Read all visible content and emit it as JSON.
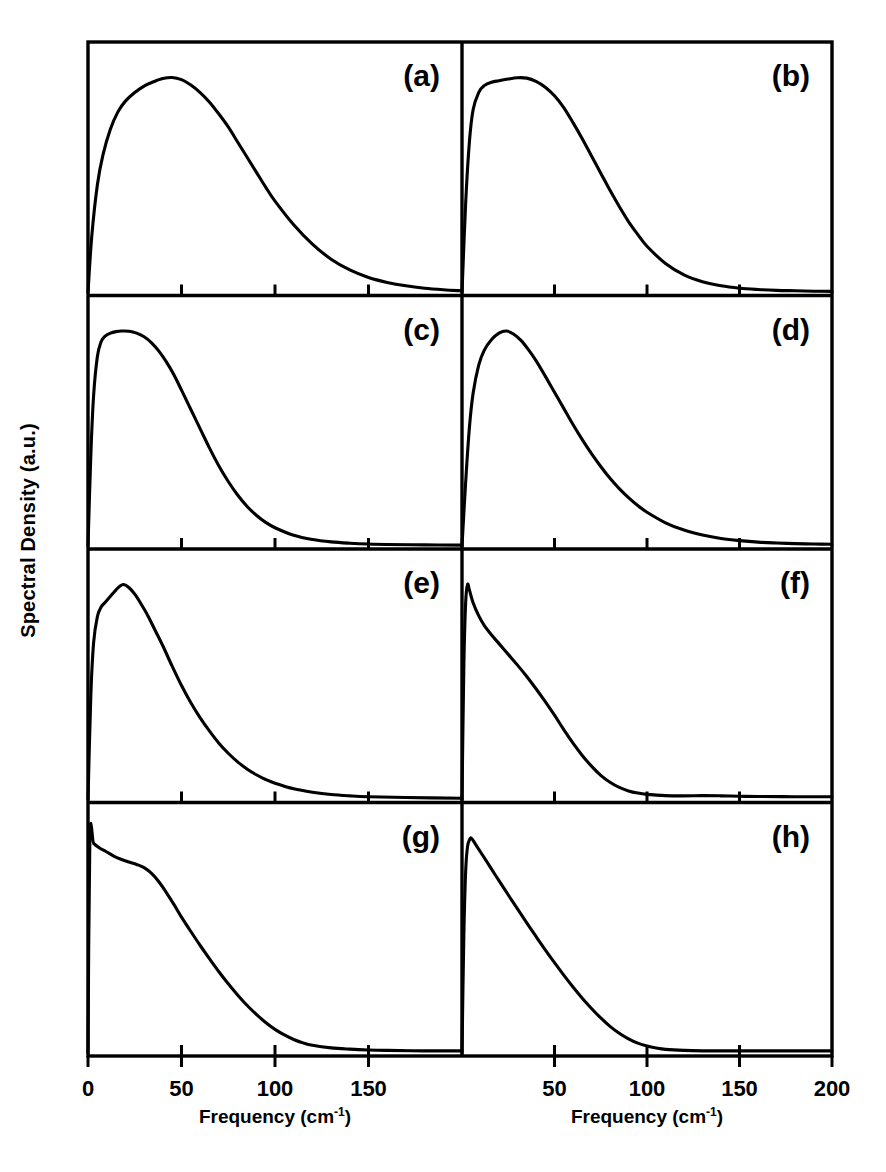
{
  "figure": {
    "ylabel": "Spectral Density (a.u.)",
    "xlabel_left_main": "Frequency (cm",
    "xlabel_left_sup": "-1",
    "xlabel_left_close": ")",
    "xlabel_right_main": "Frequency (cm",
    "xlabel_right_sup": "-1",
    "xlabel_right_close": ")",
    "line_color": "#000000",
    "axis_color": "#000000",
    "background_color": "#ffffff"
  },
  "axes": {
    "x_min": 0,
    "x_max": 200,
    "x_ticks_left": [
      0,
      50,
      100,
      150
    ],
    "x_tick_labels_left": [
      "0",
      "50",
      "100",
      "150"
    ],
    "x_ticks_right": [
      50,
      100,
      150,
      200
    ],
    "x_tick_labels_right": [
      "50",
      "100",
      "150",
      "200"
    ],
    "y_min": 0,
    "y_max": 1,
    "y_ticks": [],
    "y_tick_labels": [],
    "grid": false,
    "legend": "none"
  },
  "chart_data": {
    "type": "line",
    "title": "",
    "xlabel": "Frequency (cm-1)",
    "ylabel": "Spectral Density (a.u.)",
    "xlim": [
      0,
      200
    ],
    "ylim": [
      0,
      1
    ],
    "grid": false,
    "legend_position": "none",
    "panel_layout": {
      "rows": 4,
      "cols": 2
    },
    "panels": [
      {
        "label": "(a)",
        "row": 0,
        "col": 0,
        "peak_frequency": 45,
        "x": [
          0,
          2,
          5,
          8,
          12,
          16,
          20,
          25,
          30,
          35,
          40,
          45,
          50,
          55,
          60,
          65,
          70,
          75,
          80,
          85,
          90,
          95,
          100,
          110,
          120,
          130,
          140,
          150,
          160,
          170,
          180,
          190,
          200
        ],
        "y": [
          0.0,
          0.26,
          0.5,
          0.64,
          0.76,
          0.84,
          0.89,
          0.93,
          0.96,
          0.98,
          0.995,
          1.0,
          0.99,
          0.965,
          0.93,
          0.885,
          0.83,
          0.77,
          0.7,
          0.63,
          0.56,
          0.49,
          0.425,
          0.315,
          0.225,
          0.155,
          0.105,
          0.07,
          0.047,
          0.031,
          0.02,
          0.013,
          0.008
        ]
      },
      {
        "label": "(b)",
        "row": 0,
        "col": 1,
        "peak_frequency": 33,
        "x": [
          0,
          2,
          4,
          6,
          9,
          12,
          16,
          20,
          25,
          30,
          35,
          40,
          45,
          50,
          55,
          60,
          65,
          70,
          75,
          80,
          85,
          90,
          95,
          100,
          110,
          120,
          130,
          140,
          150,
          160,
          170,
          180,
          190,
          200
        ],
        "y": [
          0.0,
          0.42,
          0.7,
          0.85,
          0.93,
          0.962,
          0.978,
          0.985,
          0.993,
          0.999,
          0.997,
          0.982,
          0.955,
          0.915,
          0.86,
          0.79,
          0.715,
          0.635,
          0.555,
          0.475,
          0.4,
          0.33,
          0.27,
          0.215,
          0.135,
          0.082,
          0.05,
          0.031,
          0.02,
          0.014,
          0.01,
          0.008,
          0.006,
          0.005
        ]
      },
      {
        "label": "(c)",
        "row": 1,
        "col": 0,
        "peak_frequency": 22,
        "x": [
          0,
          1.5,
          3,
          5,
          7,
          9,
          12,
          15,
          18,
          22,
          26,
          30,
          34,
          38,
          42,
          46,
          50,
          55,
          60,
          65,
          70,
          75,
          80,
          85,
          90,
          95,
          100,
          110,
          120,
          130,
          140,
          150,
          160,
          180,
          200
        ],
        "y": [
          0.0,
          0.42,
          0.7,
          0.88,
          0.95,
          0.975,
          0.99,
          0.997,
          1.0,
          0.999,
          0.99,
          0.973,
          0.945,
          0.905,
          0.855,
          0.795,
          0.725,
          0.635,
          0.545,
          0.455,
          0.372,
          0.3,
          0.237,
          0.185,
          0.143,
          0.11,
          0.085,
          0.05,
          0.03,
          0.019,
          0.013,
          0.009,
          0.007,
          0.005,
          0.004
        ]
      },
      {
        "label": "(d)",
        "row": 1,
        "col": 1,
        "peak_frequency": 24,
        "x": [
          0,
          2,
          4,
          6,
          9,
          12,
          16,
          20,
          24,
          28,
          32,
          36,
          40,
          45,
          50,
          55,
          60,
          65,
          70,
          75,
          80,
          85,
          90,
          95,
          100,
          110,
          120,
          130,
          140,
          150,
          160,
          170,
          180,
          190,
          200
        ],
        "y": [
          0.0,
          0.3,
          0.55,
          0.71,
          0.84,
          0.91,
          0.96,
          0.99,
          1.0,
          0.985,
          0.955,
          0.912,
          0.862,
          0.79,
          0.715,
          0.64,
          0.565,
          0.495,
          0.43,
          0.37,
          0.315,
          0.267,
          0.225,
          0.188,
          0.157,
          0.108,
          0.074,
          0.051,
          0.035,
          0.025,
          0.018,
          0.014,
          0.011,
          0.009,
          0.008
        ]
      },
      {
        "label": "(e)",
        "row": 2,
        "col": 0,
        "peak_frequency": 19,
        "x": [
          0,
          1.5,
          3,
          5,
          7,
          9,
          12,
          15,
          17,
          19,
          22,
          25,
          28,
          32,
          36,
          40,
          45,
          50,
          55,
          60,
          65,
          70,
          75,
          80,
          85,
          90,
          95,
          100,
          110,
          120,
          130,
          140,
          150,
          170,
          200
        ],
        "y": [
          0.0,
          0.48,
          0.73,
          0.85,
          0.895,
          0.915,
          0.945,
          0.975,
          0.992,
          1.0,
          0.985,
          0.955,
          0.915,
          0.855,
          0.785,
          0.715,
          0.62,
          0.53,
          0.45,
          0.38,
          0.318,
          0.262,
          0.215,
          0.175,
          0.142,
          0.115,
          0.093,
          0.076,
          0.05,
          0.034,
          0.023,
          0.017,
          0.013,
          0.009,
          0.006
        ]
      },
      {
        "label": "(f)",
        "row": 2,
        "col": 1,
        "peak_frequency": 3,
        "x": [
          0,
          1,
          2,
          3,
          4,
          6,
          9,
          12,
          16,
          20,
          25,
          30,
          35,
          40,
          45,
          50,
          55,
          60,
          65,
          70,
          75,
          80,
          85,
          90,
          95,
          100,
          110,
          120,
          130,
          140,
          150,
          160,
          180,
          200
        ],
        "y": [
          0.0,
          0.62,
          0.92,
          1.0,
          0.975,
          0.915,
          0.855,
          0.81,
          0.765,
          0.725,
          0.675,
          0.625,
          0.572,
          0.515,
          0.455,
          0.392,
          0.325,
          0.262,
          0.205,
          0.155,
          0.112,
          0.08,
          0.056,
          0.04,
          0.03,
          0.024,
          0.018,
          0.017,
          0.018,
          0.017,
          0.015,
          0.014,
          0.013,
          0.013
        ]
      },
      {
        "label": "(g)",
        "row": 3,
        "col": 0,
        "peak_frequency": 1,
        "x": [
          0,
          1,
          3,
          6,
          10,
          14,
          18,
          22,
          26,
          30,
          34,
          38,
          42,
          46,
          50,
          55,
          60,
          65,
          70,
          75,
          80,
          85,
          90,
          95,
          100,
          105,
          110,
          115,
          120,
          130,
          140,
          150,
          160,
          180,
          200
        ],
        "y": [
          0.0,
          1.0,
          0.975,
          0.955,
          0.935,
          0.915,
          0.9,
          0.888,
          0.877,
          0.862,
          0.835,
          0.795,
          0.745,
          0.69,
          0.632,
          0.565,
          0.5,
          0.438,
          0.378,
          0.322,
          0.27,
          0.222,
          0.18,
          0.142,
          0.11,
          0.084,
          0.063,
          0.047,
          0.036,
          0.024,
          0.018,
          0.014,
          0.012,
          0.01,
          0.01
        ]
      },
      {
        "label": "(h)",
        "row": 3,
        "col": 1,
        "peak_frequency": 5,
        "x": [
          0,
          1,
          2,
          3,
          4,
          5,
          7,
          10,
          14,
          18,
          22,
          26,
          30,
          35,
          40,
          45,
          50,
          55,
          60,
          65,
          70,
          75,
          80,
          85,
          90,
          95,
          100,
          105,
          110,
          120,
          130,
          140,
          150,
          170,
          200
        ],
        "y": [
          0.0,
          0.55,
          0.85,
          0.96,
          0.99,
          1.0,
          0.975,
          0.935,
          0.882,
          0.828,
          0.775,
          0.722,
          0.67,
          0.605,
          0.542,
          0.48,
          0.42,
          0.362,
          0.307,
          0.255,
          0.207,
          0.163,
          0.124,
          0.092,
          0.066,
          0.046,
          0.032,
          0.023,
          0.017,
          0.012,
          0.01,
          0.01,
          0.01,
          0.01,
          0.01
        ]
      }
    ]
  },
  "geometry": {
    "plot_left": 88,
    "plot_right": 832,
    "plot_top": 42,
    "plot_bottom": 1056,
    "col_divider": 462,
    "row_count": 4
  }
}
